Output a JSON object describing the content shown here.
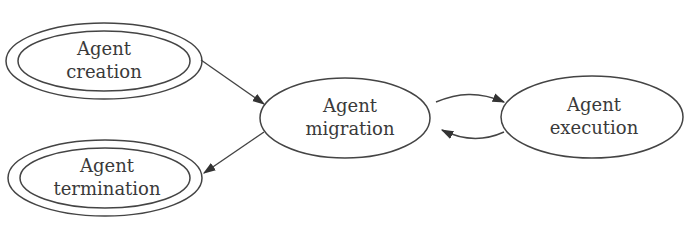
{
  "diagram": {
    "type": "state-diagram",
    "nodes": [
      {
        "id": "creation",
        "line1": "Agent",
        "line2": "creation",
        "shape": "double-ellipse"
      },
      {
        "id": "termination",
        "line1": "Agent",
        "line2": "termination",
        "shape": "double-ellipse"
      },
      {
        "id": "migration",
        "line1": "Agent",
        "line2": "migration",
        "shape": "ellipse"
      },
      {
        "id": "execution",
        "line1": "Agent",
        "line2": "execution",
        "shape": "ellipse"
      }
    ],
    "edges": [
      {
        "from": "creation",
        "to": "migration"
      },
      {
        "from": "migration",
        "to": "termination"
      },
      {
        "from": "migration",
        "to": "execution"
      },
      {
        "from": "execution",
        "to": "migration"
      }
    ],
    "colors": {
      "stroke": "#444444",
      "text": "#3a3a3a",
      "background": "#ffffff"
    }
  }
}
